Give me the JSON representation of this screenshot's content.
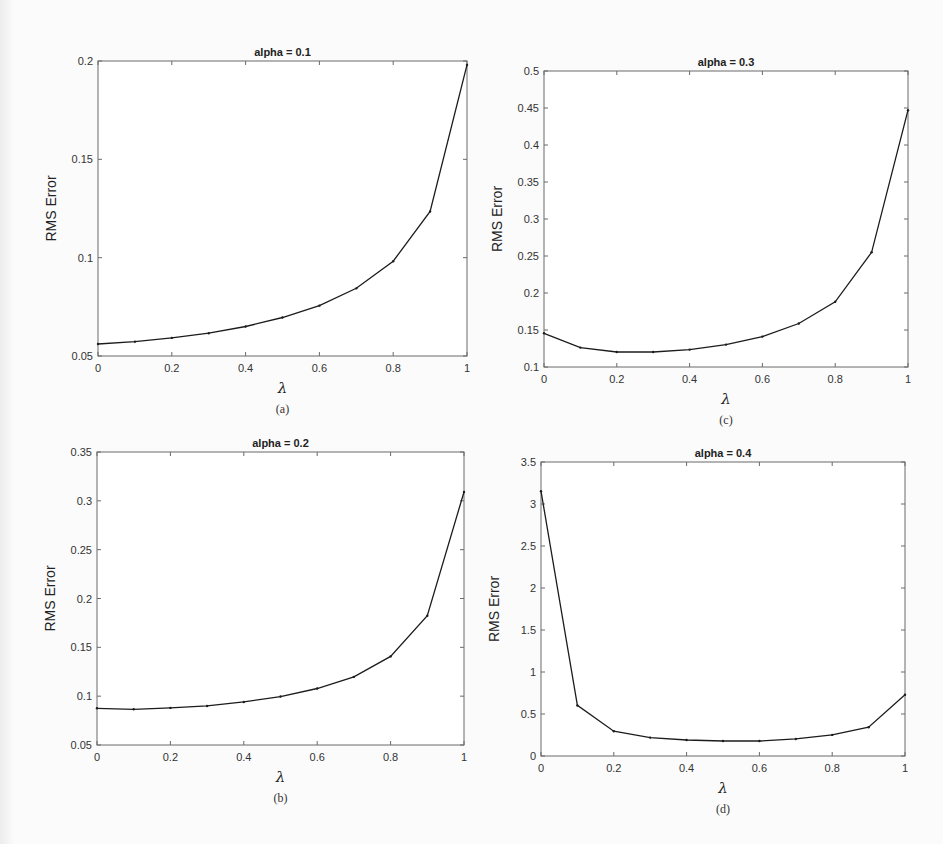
{
  "chart_data": [
    {
      "id": "a",
      "type": "line",
      "title": "alpha = 0.1",
      "xlabel": "λ",
      "ylabel": "RMS Error",
      "sublabel": "(a)",
      "x": [
        0,
        0.1,
        0.2,
        0.3,
        0.4,
        0.5,
        0.6,
        0.7,
        0.8,
        0.9,
        1.0
      ],
      "values": [
        0.0561,
        0.0573,
        0.0592,
        0.0616,
        0.065,
        0.0696,
        0.0756,
        0.0844,
        0.0982,
        0.1235,
        0.198
      ],
      "xlim": [
        0,
        1
      ],
      "ylim": [
        0.05,
        0.2
      ],
      "xticks": [
        0,
        0.2,
        0.4,
        0.6,
        0.8,
        1
      ],
      "xtick_labels": [
        "0",
        "0.2",
        "0.4",
        "0.6",
        "0.8",
        "1"
      ],
      "yticks": [
        0.05,
        0.1,
        0.15,
        0.2
      ],
      "ytick_labels": [
        "0.05",
        "0.1",
        "0.15",
        "0.2"
      ],
      "grid": false,
      "legend": null
    },
    {
      "id": "c",
      "type": "line",
      "title": "alpha = 0.3",
      "xlabel": "λ",
      "ylabel": "RMS Error",
      "sublabel": "(c)",
      "x": [
        0,
        0.1,
        0.2,
        0.3,
        0.4,
        0.5,
        0.6,
        0.7,
        0.8,
        0.9,
        1.0
      ],
      "values": [
        0.1456,
        0.1262,
        0.1203,
        0.1203,
        0.1235,
        0.1303,
        0.1411,
        0.1588,
        0.1881,
        0.255,
        0.447
      ],
      "xlim": [
        0,
        1
      ],
      "ylim": [
        0.1,
        0.5
      ],
      "xticks": [
        0,
        0.2,
        0.4,
        0.6,
        0.8,
        1
      ],
      "xtick_labels": [
        "0",
        "0.2",
        "0.4",
        "0.6",
        "0.8",
        "1"
      ],
      "yticks": [
        0.1,
        0.15,
        0.2,
        0.25,
        0.3,
        0.35,
        0.4,
        0.45,
        0.5
      ],
      "ytick_labels": [
        "0.1",
        "0.15",
        "0.2",
        "0.25",
        "0.3",
        "0.35",
        "0.4",
        "0.45",
        "0.5"
      ],
      "grid": false,
      "legend": null
    },
    {
      "id": "b",
      "type": "line",
      "title": "alpha = 0.2",
      "xlabel": "λ",
      "ylabel": "RMS Error",
      "sublabel": "(b)",
      "x": [
        0,
        0.1,
        0.2,
        0.3,
        0.4,
        0.5,
        0.6,
        0.7,
        0.8,
        0.9,
        1.0
      ],
      "values": [
        0.0876,
        0.0866,
        0.088,
        0.09,
        0.0941,
        0.0996,
        0.1078,
        0.1198,
        0.1407,
        0.1824,
        0.309
      ],
      "xlim": [
        0,
        1
      ],
      "ylim": [
        0.05,
        0.35
      ],
      "xticks": [
        0,
        0.2,
        0.4,
        0.6,
        0.8,
        1
      ],
      "xtick_labels": [
        "0",
        "0.2",
        "0.4",
        "0.6",
        "0.8",
        "1"
      ],
      "yticks": [
        0.05,
        0.1,
        0.15,
        0.2,
        0.25,
        0.3,
        0.35
      ],
      "ytick_labels": [
        "0.05",
        "0.1",
        "0.15",
        "0.2",
        "0.25",
        "0.3",
        "0.35"
      ],
      "grid": false,
      "legend": null
    },
    {
      "id": "d",
      "type": "line",
      "title": "alpha = 0.4",
      "xlabel": "λ",
      "ylabel": "RMS Error",
      "sublabel": "(d)",
      "x": [
        0,
        0.1,
        0.2,
        0.3,
        0.4,
        0.5,
        0.6,
        0.7,
        0.8,
        0.9,
        1.0
      ],
      "values": [
        3.153,
        0.602,
        0.295,
        0.219,
        0.191,
        0.179,
        0.179,
        0.203,
        0.251,
        0.343,
        0.729
      ],
      "xlim": [
        0,
        1
      ],
      "ylim": [
        0,
        3.5
      ],
      "xticks": [
        0,
        0.2,
        0.4,
        0.6,
        0.8,
        1
      ],
      "xtick_labels": [
        "0",
        "0.2",
        "0.4",
        "0.6",
        "0.8",
        "1"
      ],
      "yticks": [
        0,
        0.5,
        1,
        1.5,
        2,
        2.5,
        3,
        3.5
      ],
      "ytick_labels": [
        "0",
        "0.5",
        "1",
        "1.5",
        "2",
        "2.5",
        "3",
        "3.5"
      ],
      "grid": false,
      "legend": null
    }
  ],
  "layout": {
    "panels": {
      "a": {
        "left": 98,
        "top": 61,
        "right": 467,
        "bottom": 356
      },
      "c": {
        "left": 544,
        "top": 71,
        "right": 908,
        "bottom": 367
      },
      "b": {
        "left": 97,
        "top": 452,
        "right": 464,
        "bottom": 745
      },
      "d": {
        "left": 541,
        "top": 462,
        "right": 905,
        "bottom": 756
      }
    },
    "line_color": "#1c1c1c",
    "axis_color": "#6a6a6a"
  }
}
